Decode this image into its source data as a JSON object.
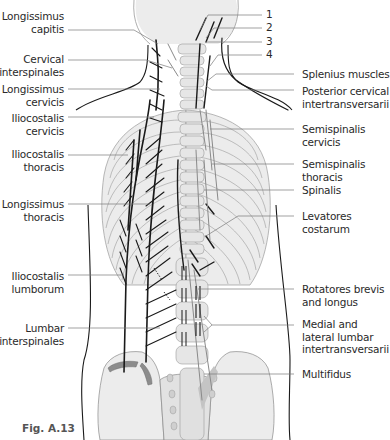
{
  "figure": {
    "caption": "Fig. A.13",
    "colors": {
      "background": "#ffffff",
      "bone_fill": "#ececec",
      "bone_outline": "#9a9a9a",
      "muscle_dark": "#1a1a1a",
      "muscle_gray": "#8a8a8a",
      "leader_line": "#7a7a7a",
      "attachment_gray": "#8c8c8c",
      "label_text": "#2a2a2a"
    }
  },
  "labels_left": [
    {
      "id": "longissimus-capitis",
      "line1": "Longissimus",
      "line2": "capitis"
    },
    {
      "id": "cervical-interspinales",
      "line1": "Cervical",
      "line2": "interspinales"
    },
    {
      "id": "longissimus-cervicis",
      "line1": "Longissimus",
      "line2": "cervicis"
    },
    {
      "id": "iliocostalis-cervicis",
      "line1": "Iliocostalis",
      "line2": "cervicis"
    },
    {
      "id": "iliocostalis-thoracis",
      "line1": "Iliocostalis",
      "line2": "thoracis"
    },
    {
      "id": "longissimus-thoracis",
      "line1": "Longissimus",
      "line2": "thoracis"
    },
    {
      "id": "iliocostalis-lumborum",
      "line1": "Iliocostalis",
      "line2": "lumborum"
    },
    {
      "id": "lumbar-interspinales",
      "line1": "Lumbar",
      "line2": "interspinales"
    }
  ],
  "labels_numbered": [
    {
      "id": "n1",
      "text": "1"
    },
    {
      "id": "n2",
      "text": "2"
    },
    {
      "id": "n3",
      "text": "3"
    },
    {
      "id": "n4",
      "text": "4"
    }
  ],
  "labels_right": [
    {
      "id": "splenius-muscles",
      "line1": "Splenius muscles",
      "line2": "",
      "line3": ""
    },
    {
      "id": "posterior-cervical-intertransversarii",
      "line1": "Posterior cervical",
      "line2": "intertransversarii",
      "line3": ""
    },
    {
      "id": "semispinalis-cervicis",
      "line1": "Semispinalis",
      "line2": "cervicis",
      "line3": ""
    },
    {
      "id": "semispinalis-thoracis",
      "line1": "Semispinalis",
      "line2": "thoracis",
      "line3": ""
    },
    {
      "id": "spinalis",
      "line1": "Spinalis",
      "line2": "",
      "line3": ""
    },
    {
      "id": "levatores-costarum",
      "line1": "Levatores",
      "line2": "costarum",
      "line3": ""
    },
    {
      "id": "rotatores-brevis-longus",
      "line1": "Rotatores brevis",
      "line2": "and longus",
      "line3": ""
    },
    {
      "id": "medial-lateral-lumbar-intertransversarii",
      "line1": "Medial and",
      "line2": "lateral lumbar",
      "line3": "intertransversarii"
    },
    {
      "id": "multifidus",
      "line1": "Multifidus",
      "line2": "",
      "line3": ""
    }
  ]
}
